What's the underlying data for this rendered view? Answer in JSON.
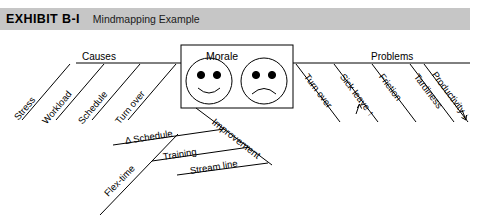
{
  "header": {
    "exhibit_label": "EXHIBIT B-I",
    "title": "Mindmapping Example",
    "bar_color": "#c6c6c6"
  },
  "diagram": {
    "type": "mindmap-fishbone",
    "center": {
      "label": "Morale",
      "faces": [
        {
          "name": "happy-face",
          "expression": "smile"
        },
        {
          "name": "sad-face",
          "expression": "frown"
        }
      ]
    },
    "branches": [
      {
        "name": "causes",
        "label": "Causes",
        "position": "left",
        "items": [
          {
            "label": "Stress"
          },
          {
            "label": "Workload"
          },
          {
            "label": "Schedule"
          },
          {
            "label": "Turn over"
          }
        ]
      },
      {
        "name": "problems",
        "label": "Problems",
        "position": "right",
        "items": [
          {
            "label": "Turn over"
          },
          {
            "label": "Sick leave ↑"
          },
          {
            "label": "Friction"
          },
          {
            "label": "Tardiness"
          },
          {
            "label": "Productivity ↓"
          }
        ]
      },
      {
        "name": "improvement",
        "label": "Improvement",
        "position": "bottom",
        "items": [
          {
            "label": "Δ Schedule"
          },
          {
            "label": "Training"
          },
          {
            "label": "Stream line"
          },
          {
            "label": "Flex-time"
          }
        ]
      }
    ],
    "line_color": "#000000",
    "background_color": "#ffffff"
  }
}
